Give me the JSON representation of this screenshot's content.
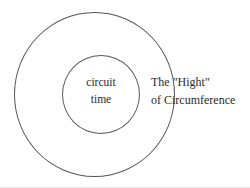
{
  "diagram": {
    "type": "concentric-circles",
    "background_color": "#ffffff",
    "stroke_color": "#565659",
    "text_color": "#2b2b2b",
    "outer_circle": {
      "name": "outer-circle",
      "label_lines": [
        "The \"Hight\"",
        "of Circumference"
      ]
    },
    "inner_circle": {
      "name": "inner-circle",
      "label_lines": [
        "circuit",
        "time"
      ]
    }
  },
  "labels": {
    "inner": {
      "line1": "circuit",
      "line2": "time"
    },
    "side": {
      "line1": "The \"Hight\"",
      "line2": "of Circumference"
    }
  }
}
